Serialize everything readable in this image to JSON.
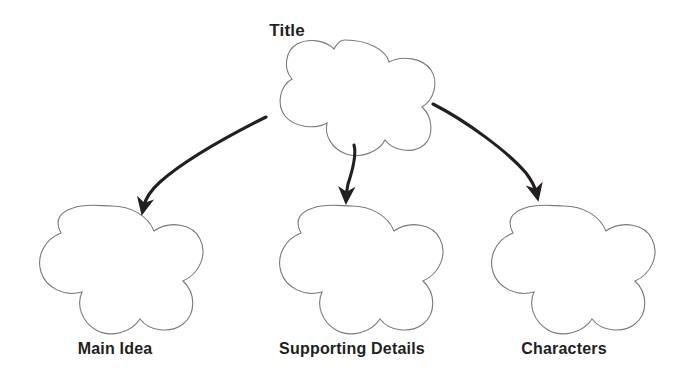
{
  "diagram": {
    "type": "graphic-organizer",
    "shape": "five-petal-flower-cloud",
    "background_color": "#ffffff",
    "outline_color": "#7a7a7a",
    "text_color": "#231f20",
    "arrow_color": "#231f20",
    "nodes": [
      {
        "id": "title",
        "label": "Title",
        "role": "root",
        "label_x": 287,
        "label_y": 22,
        "shape_cx": 345,
        "shape_cy": 93,
        "shape_rx": 90,
        "shape_ry": 53
      },
      {
        "id": "main-idea",
        "label": "Main Idea",
        "role": "child",
        "label_x": 115,
        "label_y": 341,
        "shape_cx": 112,
        "shape_cy": 267,
        "shape_rx": 90,
        "shape_ry": 62
      },
      {
        "id": "supporting-details",
        "label": "Supporting Details",
        "role": "child",
        "label_x": 352,
        "label_y": 341,
        "shape_cx": 352,
        "shape_cy": 267,
        "shape_rx": 90,
        "shape_ry": 62
      },
      {
        "id": "characters",
        "label": "Characters",
        "role": "child",
        "label_x": 564,
        "label_y": 341,
        "shape_cx": 564,
        "shape_cy": 267,
        "shape_rx": 90,
        "shape_ry": 62
      }
    ],
    "arrows": [
      {
        "id": "arrow-title-to-main-idea",
        "from": "title",
        "to": "main-idea",
        "start_x": 266,
        "start_y": 117,
        "end_x": 143,
        "end_y": 212
      },
      {
        "id": "arrow-title-to-supporting-details",
        "from": "title",
        "to": "supporting-details",
        "start_x": 354,
        "start_y": 145,
        "end_x": 346,
        "end_y": 202
      },
      {
        "id": "arrow-title-to-characters",
        "from": "title",
        "to": "characters",
        "start_x": 433,
        "start_y": 104,
        "end_x": 537,
        "end_y": 199
      }
    ]
  }
}
